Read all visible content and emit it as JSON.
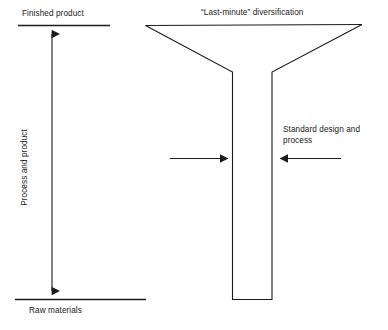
{
  "diagram": {
    "axis": {
      "top_label": "Finished product",
      "bottom_label": "Raw materials",
      "vertical_label": "Process and product",
      "arrow_name": "double-headed-vertical-arrow"
    },
    "funnel": {
      "top_label": "“Last-minute” diversification",
      "stem_label": "Standard design and process",
      "shape_name": "funnel-outline"
    },
    "arrows": {
      "into_stem": "arrow-pointing-right-into-stem",
      "to_stem": "arrow-pointing-left-to-stem"
    },
    "colors": {
      "stroke": "#1a1a1a",
      "background": "#ffffff",
      "text": "#1a1a1a"
    }
  }
}
